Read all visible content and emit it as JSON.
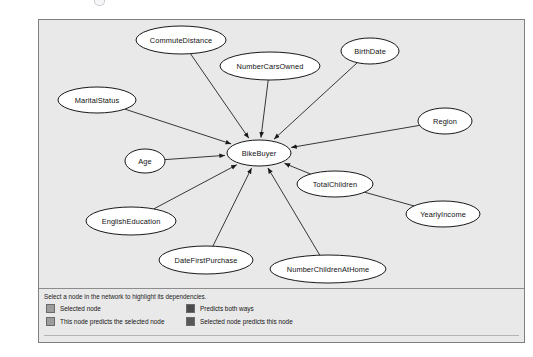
{
  "window": {
    "background_color": "#ffffff",
    "frame_border_color": "#7f7f7f",
    "pane_background_color": "#e9e9e9"
  },
  "graph": {
    "type": "dependency-network",
    "center_node": "BikeBuyer",
    "edge_direction": "all incoming to center",
    "node_fill_color": "#ffffff",
    "node_stroke_color": "#000000",
    "edge_color": "#222222",
    "nodes": [
      {
        "id": "commutedistance",
        "label": "CommuteDistance",
        "cx": 142,
        "cy": 20,
        "rx": 45,
        "ry": 14
      },
      {
        "id": "numbercarsowned",
        "label": "NumberCarsOwned",
        "cx": 231,
        "cy": 46,
        "rx": 50,
        "ry": 14
      },
      {
        "id": "birthdate",
        "label": "BirthDate",
        "cx": 331,
        "cy": 31,
        "rx": 29,
        "ry": 13
      },
      {
        "id": "maritalstatus",
        "label": "MaritalStatus",
        "cx": 58,
        "cy": 80,
        "rx": 39,
        "ry": 13
      },
      {
        "id": "region",
        "label": "Region",
        "cx": 406,
        "cy": 101,
        "rx": 27,
        "ry": 13
      },
      {
        "id": "age",
        "label": "Age",
        "cx": 106,
        "cy": 141,
        "rx": 20,
        "ry": 12
      },
      {
        "id": "bikebuyer",
        "label": "BikeBuyer",
        "cx": 220,
        "cy": 133,
        "rx": 32,
        "ry": 13
      },
      {
        "id": "totalchildren",
        "label": "TotalChildren",
        "cx": 296,
        "cy": 164,
        "rx": 38,
        "ry": 13
      },
      {
        "id": "englisheducation",
        "label": "EnglishEducation",
        "cx": 92,
        "cy": 201,
        "rx": 45,
        "ry": 14
      },
      {
        "id": "yearlyincome",
        "label": "YearlyIncome",
        "cx": 404,
        "cy": 194,
        "rx": 37,
        "ry": 13
      },
      {
        "id": "datefirstpurchase",
        "label": "DateFirstPurchase",
        "cx": 167,
        "cy": 240,
        "rx": 47,
        "ry": 14
      },
      {
        "id": "numberchildrenathome",
        "label": "NumberChildrenAtHome",
        "cx": 289,
        "cy": 249,
        "rx": 58,
        "ry": 14
      }
    ],
    "edges": [
      {
        "from": "commutedistance",
        "to": "bikebuyer",
        "arrow": true
      },
      {
        "from": "numbercarsowned",
        "to": "bikebuyer",
        "arrow": true
      },
      {
        "from": "birthdate",
        "to": "bikebuyer",
        "arrow": true
      },
      {
        "from": "maritalstatus",
        "to": "bikebuyer",
        "arrow": true
      },
      {
        "from": "region",
        "to": "bikebuyer",
        "arrow": true
      },
      {
        "from": "age",
        "to": "bikebuyer",
        "arrow": true
      },
      {
        "from": "englisheducation",
        "to": "bikebuyer",
        "arrow": true
      },
      {
        "from": "totalchildren",
        "to": "bikebuyer",
        "arrow": true
      },
      {
        "from": "datefirstpurchase",
        "to": "bikebuyer",
        "arrow": true
      },
      {
        "from": "numberchildrenathome",
        "to": "bikebuyer",
        "arrow": true
      },
      {
        "from": "yearlyincome",
        "to": "totalchildren",
        "arrow": false
      }
    ]
  },
  "legend": {
    "hint": "Select a node in the network to highlight its dependencies.",
    "items": [
      {
        "label": "Selected node",
        "color": "#9c9c9c",
        "column": "left",
        "row": 0
      },
      {
        "label": "This node predicts the selected node",
        "color": "#9c9c9c",
        "column": "left",
        "row": 1
      },
      {
        "label": "Predicts both ways",
        "color": "#4b4b4b",
        "column": "right",
        "row": 0
      },
      {
        "label": "Selected node predicts this node",
        "color": "#585858",
        "column": "right",
        "row": 1
      }
    ]
  }
}
